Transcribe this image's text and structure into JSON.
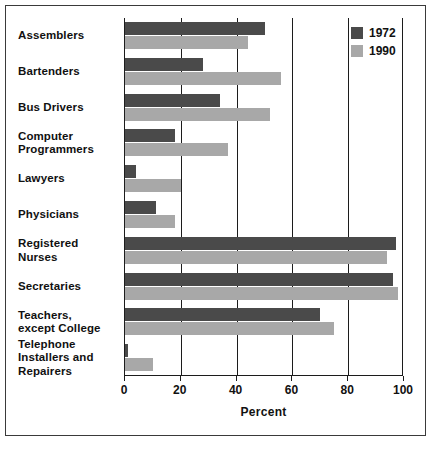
{
  "chart_data": {
    "type": "bar",
    "orientation": "horizontal",
    "title": "",
    "xlabel": "Percent",
    "ylabel": "",
    "xlim": [
      0,
      100
    ],
    "xticks": [
      0,
      20,
      40,
      60,
      80,
      100
    ],
    "xtick_labels": [
      "0",
      "20",
      "40",
      "60",
      "80",
      "100"
    ],
    "grid": true,
    "legend_position": "top-right",
    "categories": [
      "Assemblers",
      "Bartenders",
      "Bus Drivers",
      "Computer Programmers",
      "Lawyers",
      "Physicians",
      "Registered Nurses",
      "Secretaries",
      "Teachers, except College",
      "Telephone Installers and Repairers"
    ],
    "category_lines": [
      [
        "Assemblers"
      ],
      [
        "Bartenders"
      ],
      [
        "Bus Drivers"
      ],
      [
        "Computer",
        "Programmers"
      ],
      [
        "Lawyers"
      ],
      [
        "Physicians"
      ],
      [
        "Registered",
        "Nurses"
      ],
      [
        "Secretaries"
      ],
      [
        "Teachers,",
        "except College"
      ],
      [
        "Telephone",
        "Installers and",
        "Repairers"
      ]
    ],
    "series": [
      {
        "name": "1972",
        "color": "#4a4a4a",
        "values": [
          50,
          28,
          34,
          18,
          4,
          11,
          97,
          96,
          70,
          1
        ]
      },
      {
        "name": "1990",
        "color": "#a8a8a8",
        "values": [
          44,
          56,
          52,
          37,
          20,
          18,
          94,
          98,
          75,
          10
        ]
      }
    ]
  },
  "legend": {
    "entries": [
      {
        "label": "1972",
        "color": "#4a4a4a"
      },
      {
        "label": "1990",
        "color": "#a8a8a8"
      }
    ]
  },
  "axis": {
    "x_title": "Percent"
  }
}
